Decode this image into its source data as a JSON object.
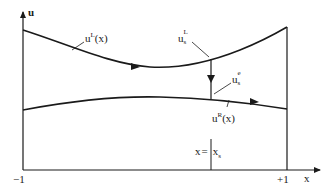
{
  "diagram": {
    "axes": {
      "y_axis_label": "u",
      "x_axis_label": "x",
      "x_left_tick": "−1",
      "x_right_tick": "+1"
    },
    "curves": {
      "upper": {
        "base": "u",
        "sup": "L",
        "arg": "(x)"
      },
      "lower": {
        "base": "u",
        "sup": "R",
        "arg": "(x)"
      }
    },
    "shock": {
      "left_state": {
        "base": "u",
        "sup": "L",
        "sub": "s"
      },
      "entropy_state": {
        "base": "u",
        "sup": "e",
        "sub": "s"
      },
      "location_label": {
        "lhs": "x",
        "eq": "=",
        "rhs_base": "x",
        "rhs_sub": "s"
      }
    },
    "colors": {
      "stroke": "#1a1a1a",
      "background": "#ffffff"
    }
  }
}
